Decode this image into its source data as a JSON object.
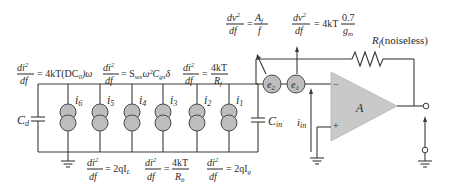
{
  "diagram": {
    "type": "circuit",
    "labels": {
      "cd": "C",
      "cd_sub": "d",
      "cin": "C",
      "cin_sub": "in",
      "iin": "i",
      "iin_sub": "in",
      "amp": "A",
      "rf": "R",
      "rf_sub": "f",
      "rf_note": "(noiseless)",
      "minus": "−",
      "plus": "+"
    },
    "sources": [
      {
        "id": "i6",
        "label": "i",
        "sub": "6"
      },
      {
        "id": "i5",
        "label": "i",
        "sub": "5"
      },
      {
        "id": "i4",
        "label": "i",
        "sub": "4"
      },
      {
        "id": "i3",
        "label": "i",
        "sub": "3"
      },
      {
        "id": "i2",
        "label": "i",
        "sub": "2"
      },
      {
        "id": "i1",
        "label": "i",
        "sub": "1"
      }
    ],
    "voltage_sources": [
      {
        "id": "e2",
        "label": "e",
        "sub": "2"
      },
      {
        "id": "e1",
        "label": "e",
        "sub": "1"
      }
    ],
    "equations": {
      "i6": {
        "num": "di",
        "num_sub": "6",
        "num_sup": "2",
        "den": "df",
        "rhs": "= 4kT(DC",
        "rhs_sub": "0",
        "rhs_tail": ")ω"
      },
      "i4": {
        "num": "di",
        "num_sub": "4",
        "num_sup": "2",
        "den": "df",
        "rhs": "= S",
        "rhs_sub": "wx",
        "rhs_tail": "ω²C",
        "rhs_tail_sub": "gs",
        "rhs_tail_sup": "2",
        "rhs_end": "δ"
      },
      "i2": {
        "num": "di",
        "num_sub": "2",
        "num_sup": "2",
        "den": "df",
        "rhs": "=",
        "frac_num": "4kT",
        "frac_den": "R",
        "frac_den_sub": "f"
      },
      "i5": {
        "num": "di",
        "num_sub": "5",
        "num_sup": "2",
        "den": "df",
        "rhs": "= 2qI",
        "rhs_sub": "L"
      },
      "i3": {
        "num": "di",
        "num_sub": "3",
        "num_sup": "2",
        "den": "df",
        "rhs": "=",
        "frac_num": "4kT",
        "frac_den": "R",
        "frac_den_sub": "b"
      },
      "i1": {
        "num": "di",
        "num_sub": "1",
        "num_sup": "2",
        "den": "df",
        "rhs": "= 2qI",
        "rhs_sub": "g"
      },
      "e2": {
        "num": "dv",
        "num_sup": "2",
        "den": "df",
        "rhs": "=",
        "frac_num": "A",
        "frac_num_sub": "f",
        "frac_den": "f"
      },
      "e1": {
        "num": "dv",
        "num_sup": "2",
        "den": "df",
        "rhs": "= 4kT",
        "frac_num": "0.7",
        "frac_den": "g",
        "frac_den_sub": "m"
      }
    }
  }
}
